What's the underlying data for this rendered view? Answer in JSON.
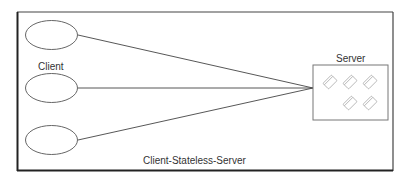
{
  "diagram": {
    "title": "Client-Stateless-Server",
    "client_label": "Client",
    "server_label": "Server",
    "clients": [
      {
        "id": "client-1"
      },
      {
        "id": "client-2"
      },
      {
        "id": "client-3"
      }
    ],
    "server": {
      "document_icon_count": 5
    },
    "colors": {
      "frame": "#333333",
      "shape_stroke": "#555555",
      "line": "#444444",
      "icon_stroke": "#aaaaaa",
      "text": "#333333",
      "background": "#ffffff"
    }
  }
}
